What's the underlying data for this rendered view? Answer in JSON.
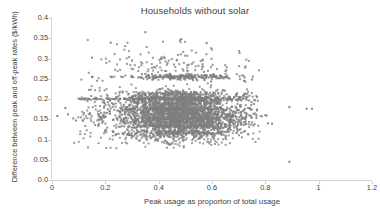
{
  "chart_data": {
    "type": "scatter",
    "title": "Households without solar",
    "xlabel": "Peak usage as proporton of total usage",
    "ylabel": "Difference between peak and off-peak rates ($/kWh)",
    "xlim": [
      0,
      1.2
    ],
    "ylim": [
      0,
      0.4
    ],
    "xticks": [
      "0",
      "0.2",
      "0.4",
      "0.6",
      "0.8",
      "1",
      "1.2"
    ],
    "xtick_values": [
      0,
      0.2,
      0.4,
      0.6,
      0.8,
      1.0,
      1.2
    ],
    "yticks": [
      "0.0",
      "0.05",
      "0.1",
      "0.15",
      "0.2",
      "0.25",
      "0.3",
      "0.35",
      "0.4"
    ],
    "ytick_values": [
      0,
      0.05,
      0.1,
      0.15,
      0.2,
      0.25,
      0.3,
      0.35,
      0.4
    ],
    "grid": false,
    "legend": false,
    "marker_color": "#7f7f7f",
    "marker_size": 2.0,
    "marker_shape": "square",
    "background_color": "#ffffff",
    "axis_color": "#d4d4d4",
    "text_color": "#3f3f3f",
    "series": [
      {
        "name": "Households without solar",
        "points": [
          [
            0.02,
            0.158
          ],
          [
            0.05,
            0.178
          ],
          [
            0.06,
            0.162
          ],
          [
            0.08,
            0.152
          ],
          [
            0.09,
            0.147
          ],
          [
            0.1,
            0.201
          ],
          [
            0.105,
            0.2
          ],
          [
            0.11,
            0.199
          ],
          [
            0.115,
            0.201
          ],
          [
            0.12,
            0.2
          ],
          [
            0.125,
            0.202
          ],
          [
            0.13,
            0.199
          ],
          [
            0.135,
            0.201
          ],
          [
            0.14,
            0.2
          ],
          [
            0.145,
            0.198
          ],
          [
            0.15,
            0.302
          ],
          [
            0.15,
            0.255
          ],
          [
            0.152,
            0.254
          ],
          [
            0.155,
            0.2
          ],
          [
            0.16,
            0.201
          ],
          [
            0.165,
            0.199
          ],
          [
            0.17,
            0.2
          ],
          [
            0.175,
            0.158
          ],
          [
            0.18,
            0.156
          ],
          [
            0.185,
            0.155
          ],
          [
            0.19,
            0.157
          ],
          [
            0.195,
            0.154
          ],
          [
            0.2,
            0.156
          ],
          [
            0.205,
            0.201
          ],
          [
            0.21,
            0.2
          ],
          [
            0.215,
            0.17
          ],
          [
            0.22,
            0.339
          ],
          [
            0.22,
            0.255
          ],
          [
            0.225,
            0.254
          ],
          [
            0.23,
            0.2
          ],
          [
            0.235,
            0.199
          ],
          [
            0.24,
            0.201
          ],
          [
            0.245,
            0.172
          ],
          [
            0.25,
            0.17
          ],
          [
            0.255,
            0.168
          ],
          [
            0.26,
            0.255
          ],
          [
            0.265,
            0.254
          ],
          [
            0.27,
            0.2
          ],
          [
            0.275,
            0.201
          ],
          [
            0.28,
            0.199
          ],
          [
            0.285,
            0.175
          ],
          [
            0.29,
            0.173
          ],
          [
            0.295,
            0.171
          ],
          [
            0.3,
            0.295
          ],
          [
            0.3,
            0.255
          ],
          [
            0.305,
            0.254
          ],
          [
            0.31,
            0.2
          ],
          [
            0.315,
            0.201
          ],
          [
            0.32,
            0.199
          ],
          [
            0.325,
            0.198
          ],
          [
            0.33,
            0.174
          ],
          [
            0.335,
            0.172
          ],
          [
            0.34,
            0.17
          ],
          [
            0.345,
            0.168
          ],
          [
            0.35,
            0.365
          ],
          [
            0.35,
            0.262
          ],
          [
            0.352,
            0.255
          ],
          [
            0.355,
            0.254
          ],
          [
            0.36,
            0.2
          ],
          [
            0.365,
            0.201
          ],
          [
            0.37,
            0.199
          ],
          [
            0.375,
            0.198
          ],
          [
            0.38,
            0.176
          ],
          [
            0.385,
            0.174
          ],
          [
            0.39,
            0.172
          ],
          [
            0.395,
            0.17
          ],
          [
            0.4,
            0.255
          ],
          [
            0.405,
            0.254
          ],
          [
            0.41,
            0.2
          ],
          [
            0.415,
            0.201
          ],
          [
            0.42,
            0.199
          ],
          [
            0.425,
            0.198
          ],
          [
            0.43,
            0.177
          ],
          [
            0.435,
            0.175
          ],
          [
            0.44,
            0.173
          ],
          [
            0.445,
            0.171
          ],
          [
            0.45,
            0.255
          ],
          [
            0.455,
            0.254
          ],
          [
            0.46,
            0.2
          ],
          [
            0.465,
            0.201
          ],
          [
            0.47,
            0.199
          ],
          [
            0.475,
            0.198
          ],
          [
            0.48,
            0.345
          ],
          [
            0.485,
            0.348
          ],
          [
            0.48,
            0.178
          ],
          [
            0.485,
            0.176
          ],
          [
            0.49,
            0.174
          ],
          [
            0.495,
            0.172
          ],
          [
            0.5,
            0.255
          ],
          [
            0.505,
            0.254
          ],
          [
            0.51,
            0.2
          ],
          [
            0.515,
            0.201
          ],
          [
            0.52,
            0.199
          ],
          [
            0.525,
            0.198
          ],
          [
            0.53,
            0.178
          ],
          [
            0.535,
            0.176
          ],
          [
            0.54,
            0.174
          ],
          [
            0.545,
            0.172
          ],
          [
            0.55,
            0.255
          ],
          [
            0.555,
            0.254
          ],
          [
            0.56,
            0.2
          ],
          [
            0.565,
            0.201
          ],
          [
            0.57,
            0.199
          ],
          [
            0.575,
            0.198
          ],
          [
            0.58,
            0.338
          ],
          [
            0.58,
            0.178
          ],
          [
            0.585,
            0.176
          ],
          [
            0.59,
            0.174
          ],
          [
            0.595,
            0.172
          ],
          [
            0.6,
            0.255
          ],
          [
            0.605,
            0.254
          ],
          [
            0.61,
            0.2
          ],
          [
            0.615,
            0.201
          ],
          [
            0.62,
            0.199
          ],
          [
            0.625,
            0.198
          ],
          [
            0.63,
            0.178
          ],
          [
            0.635,
            0.176
          ],
          [
            0.64,
            0.174
          ],
          [
            0.645,
            0.172
          ],
          [
            0.65,
            0.255
          ],
          [
            0.655,
            0.254
          ],
          [
            0.66,
            0.2
          ],
          [
            0.665,
            0.201
          ],
          [
            0.67,
            0.199
          ],
          [
            0.675,
            0.198
          ],
          [
            0.68,
            0.17
          ],
          [
            0.685,
            0.168
          ],
          [
            0.69,
            0.166
          ],
          [
            0.7,
            0.2
          ],
          [
            0.705,
            0.199
          ],
          [
            0.71,
            0.168
          ],
          [
            0.72,
            0.245
          ],
          [
            0.725,
            0.243
          ],
          [
            0.73,
            0.198
          ],
          [
            0.735,
            0.178
          ],
          [
            0.74,
            0.16
          ],
          [
            0.745,
            0.158
          ],
          [
            0.75,
            0.248
          ],
          [
            0.8,
            0.16
          ],
          [
            0.805,
            0.159
          ],
          [
            0.81,
            0.14
          ],
          [
            0.825,
            0.139
          ],
          [
            0.89,
            0.18
          ],
          [
            0.89,
            0.045
          ],
          [
            0.955,
            0.176
          ],
          [
            0.975,
            0.176
          ]
        ]
      }
    ]
  }
}
